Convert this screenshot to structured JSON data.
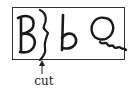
{
  "diagram": {
    "letters": [
      "B",
      "b",
      "Q"
    ],
    "cut_label": "cut",
    "stroke_color": "#1a1a1a",
    "background": "#ffffff"
  }
}
